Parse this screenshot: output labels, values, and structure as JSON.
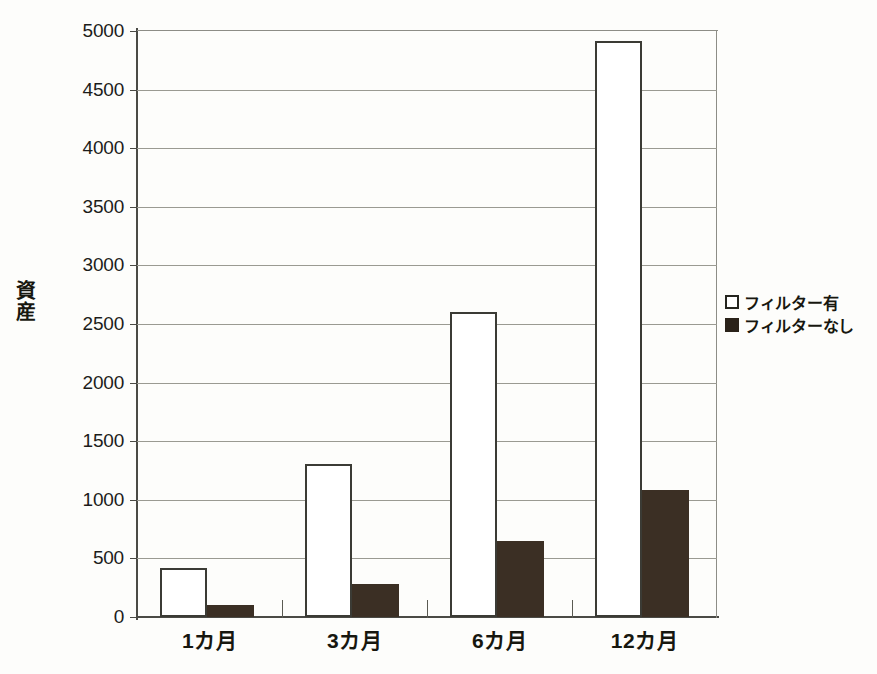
{
  "chart_data": {
    "type": "bar",
    "title": "",
    "xlabel": "",
    "ylabel": "資産",
    "ylim": [
      0,
      5000
    ],
    "ytick_step": 500,
    "yticks": [
      "0",
      "500",
      "1000",
      "1500",
      "2000",
      "2500",
      "3000",
      "3500",
      "4000",
      "4500",
      "5000"
    ],
    "categories": [
      "1カ月",
      "3カ月",
      "6カ月",
      "12カ月"
    ],
    "grid": true,
    "legend_position": "right",
    "series": [
      {
        "name": "フィルター有",
        "style": "outlined-white",
        "color": "#ffffff",
        "edge_color": "#3b3b35",
        "values": [
          420,
          1305,
          2600,
          4915
        ]
      },
      {
        "name": "フィルターなし",
        "style": "filled-dark",
        "color": "#3b2f24",
        "edge_color": "#3b2f24",
        "values": [
          100,
          280,
          650,
          1085
        ]
      }
    ]
  },
  "legend": {
    "items": [
      {
        "label": "フィルター有",
        "swatch": "light"
      },
      {
        "label": "フィルターなし",
        "swatch": "dark"
      }
    ]
  },
  "axes": {
    "y_axis_title": "資産"
  },
  "colors": {
    "background": "#fdfdfb",
    "axis": "#4a4a45",
    "gridline": "#9a9a92",
    "series_light": "#ffffff",
    "series_dark": "#3b2f24",
    "text": "#17170f"
  }
}
